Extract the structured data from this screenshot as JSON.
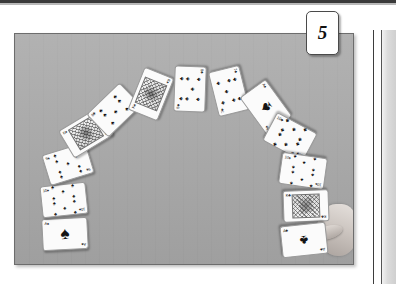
{
  "page": {
    "badge_number": "5",
    "background_color": "#ffffff"
  },
  "photo": {
    "name": "card-arc-photograph",
    "table_color": "#a9a9a9",
    "border_color": "#6d6d6d",
    "description": "Thirteen playing cards laid face-up in a semicircular arc on a grey table, with a hand placing the last card at the lower right."
  },
  "hand": {
    "name": "hand-placing-card",
    "visible": true
  },
  "cards": [
    {
      "id": "c1",
      "rank": "A",
      "suit": "spades",
      "suit_glyph": "♠",
      "corner": "A♠",
      "pip_count": 1,
      "face": false,
      "x": 27,
      "y": 184,
      "rotate": -3,
      "label": "ace-of-spades"
    },
    {
      "id": "c2",
      "rank": "10",
      "suit": "spades",
      "suit_glyph": "♠",
      "corner": "10♠",
      "pip_count": 10,
      "face": false,
      "x": 26,
      "y": 150,
      "rotate": -6,
      "label": "ten-of-spades"
    },
    {
      "id": "c3",
      "rank": "9",
      "suit": "spades",
      "suit_glyph": "♠",
      "corner": "9♠",
      "pip_count": 9,
      "face": false,
      "x": 30,
      "y": 114,
      "rotate": -17,
      "label": "nine-of-spades"
    },
    {
      "id": "c4",
      "rank": "K",
      "suit": "spades",
      "suit_glyph": "♠",
      "corner": "K♠",
      "pip_count": 0,
      "face": true,
      "x": 48,
      "y": 83,
      "rotate": -31,
      "label": "king-of-spades"
    },
    {
      "id": "c5",
      "rank": "8",
      "suit": "clubs",
      "suit_glyph": "♣",
      "corner": "8♣",
      "pip_count": 8,
      "face": false,
      "x": 76,
      "y": 60,
      "rotate": -44,
      "label": "eight-of-clubs"
    },
    {
      "id": "c6",
      "rank": "K",
      "suit": "spades",
      "suit_glyph": "♠",
      "corner": "K♠",
      "pip_count": 0,
      "face": true,
      "x": 113,
      "y": 44,
      "rotate": -68,
      "label": "king-of-spades-2"
    },
    {
      "id": "c7",
      "rank": "8",
      "suit": "clubs",
      "suit_glyph": "♣",
      "corner": "8♣",
      "pip_count": 8,
      "face": false,
      "x": 152,
      "y": 39,
      "rotate": -88,
      "label": "eight-of-clubs-2"
    },
    {
      "id": "c8",
      "rank": "7",
      "suit": "clubs",
      "suit_glyph": "♣",
      "corner": "7♣",
      "pip_count": 7,
      "face": false,
      "x": 191,
      "y": 41,
      "rotate": -104,
      "label": "seven-of-clubs"
    },
    {
      "id": "c9",
      "rank": "A",
      "suit": "spades",
      "suit_glyph": "♠",
      "corner": "A♠",
      "pip_count": 1,
      "face": false,
      "x": 228,
      "y": 57,
      "rotate": -126,
      "label": "ace-of-spades-2"
    },
    {
      "id": "c10",
      "rank": "10",
      "suit": "clubs",
      "suit_glyph": "♣",
      "corner": "10♣",
      "pip_count": 10,
      "face": false,
      "x": 252,
      "y": 87,
      "rotate": -152,
      "label": "ten-of-clubs"
    },
    {
      "id": "c11",
      "rank": "10",
      "suit": "spades",
      "suit_glyph": "♠",
      "corner": "10♠",
      "pip_count": 10,
      "face": false,
      "x": 265,
      "y": 121,
      "rotate": -172,
      "label": "ten-of-spades-2"
    },
    {
      "id": "c12",
      "rank": "K",
      "suit": "clubs",
      "suit_glyph": "♣",
      "corner": "K♣",
      "pip_count": 0,
      "face": true,
      "x": 268,
      "y": 156,
      "rotate": -182,
      "label": "king-of-clubs"
    },
    {
      "id": "c13",
      "rank": "A",
      "suit": "clubs",
      "suit_glyph": "♣",
      "corner": "A♣",
      "pip_count": 1,
      "face": false,
      "x": 266,
      "y": 190,
      "rotate": -186,
      "label": "ace-of-clubs"
    }
  ]
}
